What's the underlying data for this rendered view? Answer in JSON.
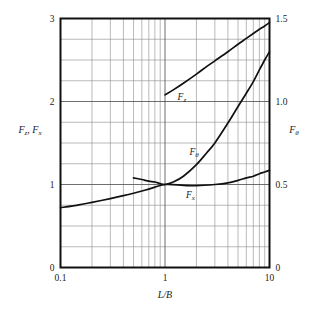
{
  "chart_data": {
    "type": "line",
    "title": "",
    "xlabel": "L/B",
    "ylabel": "Fz, Fx",
    "ylabel_right": "Fθ",
    "xscale": "log",
    "xlim": [
      0.1,
      10
    ],
    "ylim": [
      0,
      3
    ],
    "ylim_right": [
      0,
      1.5
    ],
    "grid": true,
    "legend": "none",
    "x_tick_labels": [
      "0.1",
      "1",
      "10"
    ],
    "x_tick_values": [
      0.1,
      1,
      10
    ],
    "y_tick_labels": [
      "0",
      "1",
      "2",
      "3"
    ],
    "y_tick_values": [
      0,
      1,
      2,
      3
    ],
    "y_right_tick_labels": [
      "0",
      "0.5",
      "1.0",
      "1.5"
    ],
    "y_right_tick_values": [
      0,
      0.5,
      1.0,
      1.5
    ],
    "minor_x_decades": [
      2,
      3,
      4,
      5,
      6,
      7,
      8,
      9
    ],
    "y_minor_step": 0.25,
    "series": [
      {
        "name": "Fz",
        "axis": "left",
        "label": "F",
        "label_sub": "z",
        "label_x": 1.45,
        "label_y": 2.02,
        "x": [
          1.0,
          1.2,
          1.5,
          2.0,
          2.5,
          3.0,
          4.0,
          5.0,
          6.0,
          7.0,
          8.0,
          9.0,
          10.0
        ],
        "y": [
          2.08,
          2.14,
          2.22,
          2.33,
          2.42,
          2.49,
          2.6,
          2.69,
          2.76,
          2.82,
          2.87,
          2.91,
          2.95
        ]
      },
      {
        "name": "Ftheta",
        "axis": "right",
        "label": "F",
        "label_sub": "θ",
        "label_x": 1.9,
        "label_y": 1.36,
        "x": [
          0.5,
          0.6,
          0.7,
          0.8,
          0.9,
          1.0,
          1.2,
          1.5,
          2.0,
          2.5,
          3.0,
          4.0,
          5.0,
          6.0,
          7.0,
          8.0,
          9.0,
          10.0
        ],
        "y_right": [
          0.54,
          0.53,
          0.52,
          0.515,
          0.505,
          0.5,
          0.515,
          0.55,
          0.62,
          0.69,
          0.75,
          0.87,
          0.97,
          1.05,
          1.12,
          1.19,
          1.25,
          1.3
        ],
        "y_left_equiv": [
          1.08,
          1.06,
          1.04,
          1.03,
          1.01,
          1.0,
          1.03,
          1.1,
          1.24,
          1.38,
          1.5,
          1.74,
          1.94,
          2.1,
          2.24,
          2.38,
          2.5,
          2.6
        ]
      },
      {
        "name": "Fx",
        "axis": "left",
        "label": "F",
        "label_sub": "x",
        "label_x": 1.75,
        "label_y": 0.84,
        "x": [
          0.1,
          0.15,
          0.2,
          0.3,
          0.4,
          0.5,
          0.7,
          1.0,
          1.5,
          2.0,
          3.0,
          4.0,
          5.0,
          6.0,
          7.0,
          8.0,
          9.0,
          10.0
        ],
        "y": [
          0.72,
          0.755,
          0.785,
          0.83,
          0.865,
          0.895,
          0.945,
          1.0,
          0.99,
          0.985,
          1.0,
          1.02,
          1.05,
          1.08,
          1.1,
          1.13,
          1.15,
          1.17
        ]
      }
    ]
  }
}
